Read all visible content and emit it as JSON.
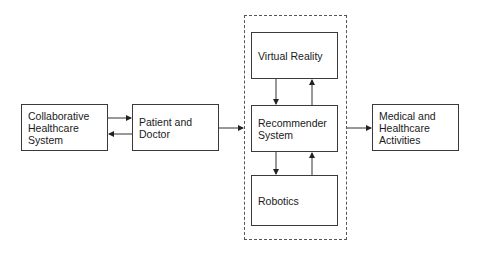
{
  "diagram": {
    "nodes": [
      {
        "id": "collab",
        "label": "Collaborative\nHealthcare\nSystem"
      },
      {
        "id": "patient",
        "label": "Patient and\nDoctor"
      },
      {
        "id": "vr",
        "label": "Virtual Reality"
      },
      {
        "id": "recommender",
        "label": "Recommender\nSystem"
      },
      {
        "id": "robotics",
        "label": "Robotics"
      },
      {
        "id": "medical",
        "label": "Medical and\nHealthcare\nActivities"
      }
    ],
    "group": {
      "id": "dashed-group",
      "members": [
        "vr",
        "recommender",
        "robotics"
      ]
    },
    "edges": [
      {
        "from": "collab",
        "to": "patient"
      },
      {
        "from": "patient",
        "to": "collab"
      },
      {
        "from": "patient",
        "to": "dashed-group"
      },
      {
        "from": "vr",
        "to": "recommender"
      },
      {
        "from": "recommender",
        "to": "vr"
      },
      {
        "from": "recommender",
        "to": "robotics"
      },
      {
        "from": "robotics",
        "to": "recommender"
      },
      {
        "from": "dashed-group",
        "to": "medical"
      }
    ]
  }
}
